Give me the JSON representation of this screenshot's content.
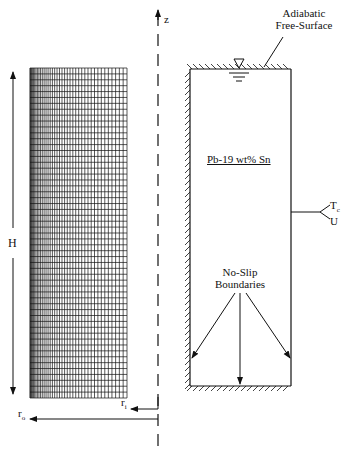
{
  "figure": {
    "axis": {
      "z_label": "z",
      "r_inner_label": "r",
      "r_inner_sub": "i",
      "r_outer_label": "r",
      "r_outer_sub": "o",
      "height_label": "H"
    },
    "mesh": {
      "description": "computational grid, refined toward inner radius",
      "columns": 40,
      "rows": 56
    },
    "domain": {
      "material_label": "Pb-19 wt% Sn",
      "top_label_line1": "Adiabatic",
      "top_label_line2": "Free-Surface",
      "outer_bc_label_line1": "T",
      "outer_bc_label_line1_sub": "c",
      "outer_bc_label_line2": "U",
      "no_slip_line1": "No-Slip",
      "no_slip_line2": "Boundaries"
    },
    "colors": {
      "ink": "#111111",
      "background": "#ffffff"
    }
  }
}
